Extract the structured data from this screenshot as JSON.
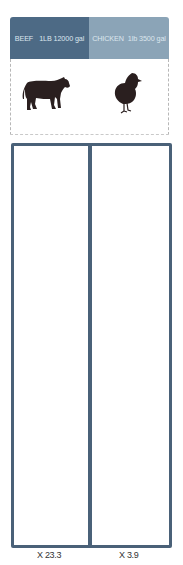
{
  "header": {
    "beef": {
      "name": "BEEF",
      "amount": "1LB 12000 gal",
      "color": "#4d6a85"
    },
    "chicken": {
      "name": "CHICKEN",
      "amount": "1lb 3500 gal",
      "color": "#8ba4b7"
    }
  },
  "animals": [
    {
      "name": "cow",
      "icon": "cow-icon"
    },
    {
      "name": "chicken",
      "icon": "chick-icon"
    }
  ],
  "grid": {
    "background": "#4a6178",
    "icon": "water-bottle-icon",
    "panels": [
      {
        "label": "beef-water-grid",
        "columns": 17,
        "rows": 44
      },
      {
        "label": "chicken-water-grid",
        "columns": 17,
        "rows": 44
      }
    ]
  },
  "multipliers": {
    "beef": "X 23.3",
    "chicken": "X 3.9"
  }
}
